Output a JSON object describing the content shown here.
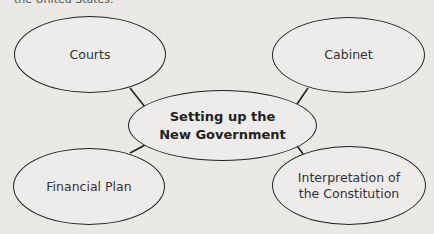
{
  "top_text": "the United States.",
  "diagram": {
    "center": "Setting up the New Government",
    "nodes": [
      {
        "id": "courts",
        "label": "Courts"
      },
      {
        "id": "cabinet",
        "label": "Cabinet"
      },
      {
        "id": "financial-plan",
        "label": "Financial Plan"
      },
      {
        "id": "interpretation",
        "label": "Interpretation of the Constitution"
      }
    ]
  }
}
